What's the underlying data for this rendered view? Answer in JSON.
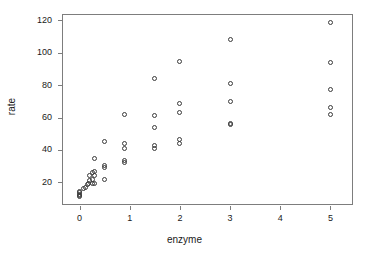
{
  "chart_data": {
    "type": "scatter",
    "title": "",
    "xlabel": "enzyme",
    "ylabel": "rate",
    "xlim": [
      -0.35,
      5.45
    ],
    "ylim": [
      6,
      124
    ],
    "grid": false,
    "legend": null,
    "marker": "open-circle",
    "xticks": [
      0,
      1,
      2,
      3,
      4,
      5
    ],
    "xtick_labels": [
      "0",
      "1",
      "2",
      "3",
      "4",
      "5"
    ],
    "yticks": [
      20,
      40,
      60,
      80,
      100,
      120
    ],
    "ytick_labels": [
      "20",
      "40",
      "60",
      "80",
      "100",
      "120"
    ],
    "points": [
      {
        "x": 0,
        "y": 11
      },
      {
        "x": 0,
        "y": 12
      },
      {
        "x": 0,
        "y": 12.5
      },
      {
        "x": 0,
        "y": 13.5
      },
      {
        "x": 0,
        "y": 14.5
      },
      {
        "x": 0.08,
        "y": 16
      },
      {
        "x": 0.12,
        "y": 17
      },
      {
        "x": 0.15,
        "y": 18.5
      },
      {
        "x": 0.18,
        "y": 19
      },
      {
        "x": 0.2,
        "y": 21
      },
      {
        "x": 0.2,
        "y": 24
      },
      {
        "x": 0.25,
        "y": 19
      },
      {
        "x": 0.25,
        "y": 22
      },
      {
        "x": 0.25,
        "y": 26
      },
      {
        "x": 0.3,
        "y": 19
      },
      {
        "x": 0.3,
        "y": 24.5
      },
      {
        "x": 0.3,
        "y": 26.5
      },
      {
        "x": 0.3,
        "y": 34.5
      },
      {
        "x": 0.5,
        "y": 21.5
      },
      {
        "x": 0.5,
        "y": 29
      },
      {
        "x": 0.5,
        "y": 30.5
      },
      {
        "x": 0.5,
        "y": 45
      },
      {
        "x": 0.9,
        "y": 32.5
      },
      {
        "x": 0.9,
        "y": 33.5
      },
      {
        "x": 0.9,
        "y": 41
      },
      {
        "x": 0.9,
        "y": 44
      },
      {
        "x": 0.9,
        "y": 62
      },
      {
        "x": 1.5,
        "y": 41
      },
      {
        "x": 1.5,
        "y": 43
      },
      {
        "x": 1.5,
        "y": 54
      },
      {
        "x": 1.5,
        "y": 61
      },
      {
        "x": 1.5,
        "y": 84
      },
      {
        "x": 2,
        "y": 44
      },
      {
        "x": 2,
        "y": 46.5
      },
      {
        "x": 2,
        "y": 63
      },
      {
        "x": 2,
        "y": 69
      },
      {
        "x": 2,
        "y": 94.5
      },
      {
        "x": 3,
        "y": 55.5
      },
      {
        "x": 3,
        "y": 56.5
      },
      {
        "x": 3,
        "y": 70
      },
      {
        "x": 3,
        "y": 81
      },
      {
        "x": 3,
        "y": 108
      },
      {
        "x": 5,
        "y": 62
      },
      {
        "x": 5,
        "y": 66.5
      },
      {
        "x": 5,
        "y": 77.5
      },
      {
        "x": 5,
        "y": 94
      },
      {
        "x": 5,
        "y": 118.5
      }
    ]
  },
  "style": {
    "marker_color": "#3a3a3a",
    "frame_color": "#7d7d7d",
    "text_color": "#1a1a1a",
    "background": "#ffffff"
  }
}
